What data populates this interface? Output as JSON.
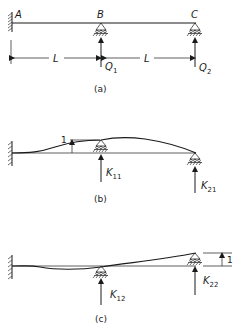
{
  "figure": {
    "panel_a": {
      "caption": "(a)",
      "points": {
        "A": "A",
        "B": "B",
        "C": "C"
      },
      "dimensions": [
        "L",
        "L"
      ],
      "forces": [
        {
          "label": "Q",
          "subscript": "1"
        },
        {
          "label": "Q",
          "subscript": "2"
        }
      ]
    },
    "panel_b": {
      "caption": "(b)",
      "unit_displacement": "1",
      "forces": [
        {
          "label": "K",
          "subscript": "11"
        },
        {
          "label": "K",
          "subscript": "21"
        }
      ]
    },
    "panel_c": {
      "caption": "(c)",
      "unit_displacement": "1",
      "forces": [
        {
          "label": "K",
          "subscript": "12"
        },
        {
          "label": "K",
          "subscript": "22"
        }
      ]
    }
  }
}
